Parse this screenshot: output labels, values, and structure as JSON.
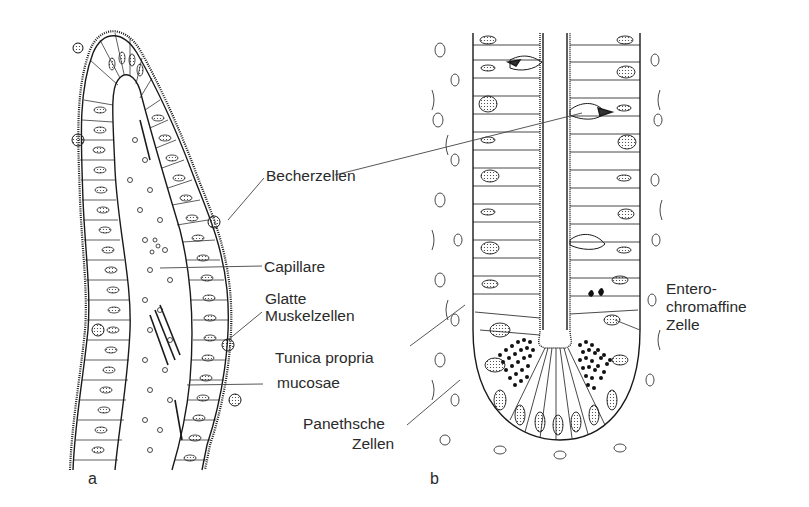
{
  "figure": {
    "panels": [
      {
        "id": "a",
        "letter": "a",
        "subject": "villus"
      },
      {
        "id": "b",
        "letter": "b",
        "subject": "crypt"
      }
    ],
    "labels": {
      "becherzellen": "Becherzellen",
      "capillare": "Capillare",
      "glatte_line1": "Glatte",
      "glatte_line2": "Muskelzellen",
      "tunica_line1": "Tunica propria",
      "tunica_line2": "mucosae",
      "paneth_line1": "Panethsche",
      "paneth_line2": "Zellen",
      "entero_line1": "Entero-",
      "entero_line2": "chromaffine",
      "entero_line3": "Zelle"
    },
    "colors": {
      "ink": "#1a1a1a",
      "leader": "#444444",
      "background": "#ffffff"
    }
  }
}
